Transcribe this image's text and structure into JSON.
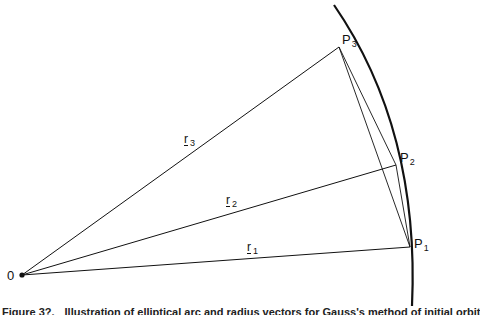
{
  "figure": {
    "origin": {
      "label": "0",
      "x": 22,
      "y": 275
    },
    "points": [
      {
        "id": "P1",
        "label": "P",
        "sub": "1",
        "x": 410,
        "y": 247
      },
      {
        "id": "P2",
        "label": "P",
        "sub": "2",
        "x": 396,
        "y": 165
      },
      {
        "id": "P3",
        "label": "P",
        "sub": "3",
        "x": 339,
        "y": 47
      }
    ],
    "vectors": [
      {
        "id": "r1",
        "label": "r",
        "sub": "1"
      },
      {
        "id": "r2",
        "label": "r",
        "sub": "2"
      },
      {
        "id": "r3",
        "label": "r",
        "sub": "3"
      }
    ],
    "chords": [
      "P3-P1",
      "P3-P2",
      "P2-P1"
    ],
    "arc": {
      "start": [
        334,
        5
      ],
      "end": [
        412,
        306
      ]
    }
  },
  "caption": {
    "number": "Figure 3?.",
    "text": "Illustration of elliptical arc and radius vectors for Gauss's method of initial orbit"
  }
}
